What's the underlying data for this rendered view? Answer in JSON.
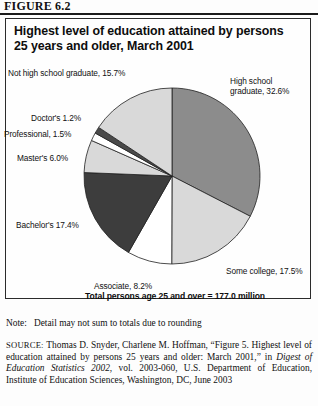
{
  "figure": {
    "number_label": "FIGURE 6.2",
    "title": "Highest level of education attained by persons 25 years and older, March 2001",
    "total_caption": "Total persons age 25 and over = 177.0 million",
    "note_label": "Note:",
    "note_text": "Detail may not sum to totals due to rounding",
    "source_label": "SOURCE:",
    "source_part1": "Thomas D. Snyder, Charlene M. Hoffman, “Figure 5. Highest level of education attained by persons 25 years and older: March 2001,” in ",
    "source_italic": "Digest of Education Statistics 2002",
    "source_part2": ", vol. 2003-060,  U.S. Department of Education, Institute of Education Sciences, Washington, DC, June 2003"
  },
  "chart_data": {
    "type": "pie",
    "title": "Highest level of education attained by persons 25 years and older, March 2001",
    "unit": "percent",
    "total_label": "Total persons age 25 and over = 177.0 million",
    "total_millions": 177.0,
    "start_angle_deg": 0,
    "direction": "clockwise",
    "legend": "labels placed around pie",
    "slices": [
      {
        "label": "High school graduate",
        "value": 32.6,
        "display": "High school graduate, 32.6%",
        "color": "#8c8c8c"
      },
      {
        "label": "Some college",
        "value": 17.5,
        "display": "Some college, 17.5%",
        "color": "#d9d9d9"
      },
      {
        "label": "Associate",
        "value": 8.2,
        "display": "Associate, 8.2%",
        "color": "#ffffff"
      },
      {
        "label": "Bachelor's",
        "value": 17.4,
        "display": "Bachelor's 17.4%",
        "color": "#3d3d3d"
      },
      {
        "label": "Master's",
        "value": 6.0,
        "display": "Master's 6.0%",
        "color": "#d9d9d9"
      },
      {
        "label": "Professional",
        "value": 1.5,
        "display": "Professional, 1.5%",
        "color": "#ffffff"
      },
      {
        "label": "Doctor's",
        "value": 1.2,
        "display": "Doctor's 1.2%",
        "color": "#4a4a4a"
      },
      {
        "label": "Not high school graduate",
        "value": 15.7,
        "display": "Not high school graduate, 15.7%",
        "color": "#d9d9d9"
      }
    ]
  },
  "labels": {
    "not_hs": "Not high school graduate, 15.7%",
    "doctors": "Doctor's 1.2%",
    "professional": "Professional, 1.5%",
    "masters": "Master's 6.0%",
    "bachelors": "Bachelor's 17.4%",
    "associate": "Associate, 8.2%",
    "some_college": "Some college, 17.5%",
    "high_school": "High school graduate, 32.6%"
  }
}
